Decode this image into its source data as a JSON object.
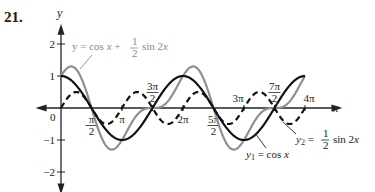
{
  "problem_number": "21.",
  "chart_data": {
    "type": "line",
    "title": "",
    "xlabel": "x",
    "ylabel": "y",
    "xlim_pi_units": [
      -0.45,
      4.45
    ],
    "ylim": [
      -2.3,
      2.6
    ],
    "grid": false,
    "x_ticks": [
      {
        "value_pi": 0.5,
        "label_num": "π",
        "label_den": "2"
      },
      {
        "value_pi": 1,
        "label": "π"
      },
      {
        "value_pi": 1.5,
        "label_num": "3π",
        "label_den": "2"
      },
      {
        "value_pi": 2,
        "label": "2π"
      },
      {
        "value_pi": 2.5,
        "label_num": "5π",
        "label_den": "2"
      },
      {
        "value_pi": 3,
        "label": "3π"
      },
      {
        "value_pi": 3.5,
        "label_num": "7π",
        "label_den": "2"
      },
      {
        "value_pi": 4,
        "label": "4π"
      }
    ],
    "y_ticks": [
      {
        "value": 2,
        "label": "2"
      },
      {
        "value": 1,
        "label": "1"
      },
      {
        "value": -1,
        "label": "−1"
      },
      {
        "value": -2,
        "label": "−2"
      }
    ],
    "origin_label": "0",
    "x_domain_pi": [
      0,
      4
    ],
    "series": [
      {
        "name": "y1",
        "expression": "cos x",
        "style": "solid",
        "color": "#111111",
        "label_parts": [
          "y",
          "1",
          " = cos ",
          "x"
        ]
      },
      {
        "name": "y2",
        "expression": "(1/2) sin 2x",
        "style": "dashed",
        "color": "#111111",
        "label_parts": [
          "y",
          "2",
          " = ",
          "1",
          "2",
          " sin 2",
          "x"
        ]
      },
      {
        "name": "sum",
        "expression": "cos x + (1/2) sin 2x",
        "style": "solid",
        "color": "#8f8f8f",
        "label_parts": [
          "y = cos ",
          "x",
          " + ",
          "1",
          "2",
          " sin 2",
          "x"
        ]
      }
    ]
  }
}
